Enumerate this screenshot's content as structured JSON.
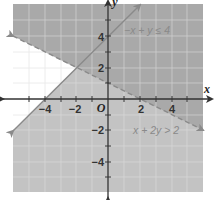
{
  "graph": {
    "type": "system-of-inequalities",
    "x_axis_label": "x",
    "y_axis_label": "y",
    "origin_label": "O",
    "x_range": [
      -6,
      6
    ],
    "y_range": [
      -6,
      6
    ],
    "x_tick_labels": [
      {
        "value": -4,
        "label": "−4"
      },
      {
        "value": -2,
        "label": "−2"
      },
      {
        "value": 2,
        "label": "2"
      },
      {
        "value": 4,
        "label": "4"
      }
    ],
    "y_tick_labels": [
      {
        "value": 4,
        "label": "4"
      },
      {
        "value": 2,
        "label": "2"
      },
      {
        "value": -2,
        "label": "−2"
      },
      {
        "value": -4,
        "label": "−4"
      }
    ],
    "inequalities": [
      {
        "label": "−x + y ≤ 4",
        "boundary": "y = x + 4",
        "line_style": "solid",
        "from": [
          -6,
          -2
        ],
        "to": [
          2,
          6
        ]
      },
      {
        "label": "x + 2y > 2",
        "boundary": "y = 1 − x/2",
        "line_style": "dashed",
        "from": [
          -6,
          4
        ],
        "to": [
          6,
          -2
        ]
      }
    ],
    "colors": {
      "overlap_region": "#a9a9a9",
      "single_region": "#c3c3c3",
      "unshaded_region": "#ffffff",
      "grid": "#dcdcdc",
      "axes": "#333333",
      "boundary": "#8a8a8a"
    }
  }
}
